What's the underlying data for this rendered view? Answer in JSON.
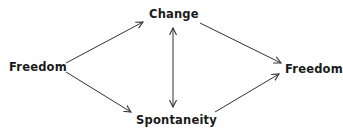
{
  "diagram": {
    "nodes": [
      {
        "id": "freedom_start",
        "label": "Freedom"
      },
      {
        "id": "change",
        "label": "Change"
      },
      {
        "id": "spontaneity",
        "label": "Spontaneity"
      },
      {
        "id": "freedom_end",
        "label": "Freedom"
      }
    ],
    "edges": [
      {
        "from": "freedom_start",
        "to": "change",
        "type": "directed"
      },
      {
        "from": "freedom_start",
        "to": "spontaneity",
        "type": "directed"
      },
      {
        "from": "change",
        "to": "spontaneity",
        "type": "bidirectional"
      },
      {
        "from": "change",
        "to": "freedom_end",
        "type": "directed"
      },
      {
        "from": "spontaneity",
        "to": "freedom_end",
        "type": "directed"
      }
    ],
    "colors": {
      "text": "#1a1a1a",
      "line": "#333333",
      "background": "#ffffff"
    }
  }
}
